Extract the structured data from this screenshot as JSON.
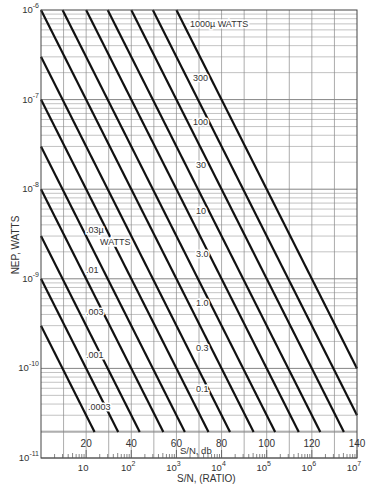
{
  "chart_data": {
    "type": "line",
    "title": "",
    "xlabel": "S/N, (RATIO)",
    "xlabel_secondary": "S/N, db",
    "ylabel": "NEP, WATTS",
    "xscale": "log",
    "yscale": "log",
    "xlim": [
      1,
      10000000
    ],
    "ylim": [
      1e-11,
      1e-06
    ],
    "grid": true,
    "legend": "none (inline line labels)",
    "x_ticks": [
      {
        "value": 10,
        "label": "10"
      },
      {
        "value": 100,
        "label": "10",
        "sup": "2"
      },
      {
        "value": 1000,
        "label": "10",
        "sup": "3"
      },
      {
        "value": 10000,
        "label": "10",
        "sup": "4"
      },
      {
        "value": 100000,
        "label": "10",
        "sup": "5"
      },
      {
        "value": 1000000,
        "label": "10",
        "sup": "6"
      },
      {
        "value": 10000000,
        "label": "10",
        "sup": "7"
      }
    ],
    "db_ticks": [
      {
        "db": 20,
        "label": "20"
      },
      {
        "db": 40,
        "label": "40"
      },
      {
        "db": 60,
        "label": "60"
      },
      {
        "db": 80,
        "label": "80"
      },
      {
        "db": 100,
        "label": "100"
      },
      {
        "db": 120,
        "label": "120"
      },
      {
        "db": 140,
        "label": "140"
      }
    ],
    "y_ticks": [
      {
        "value": 1e-06,
        "label": "10",
        "sup": "-6"
      },
      {
        "value": 1e-07,
        "label": "10",
        "sup": "-7"
      },
      {
        "value": 1e-08,
        "label": "10",
        "sup": "-8"
      },
      {
        "value": 1e-09,
        "label": "10",
        "sup": "-9"
      },
      {
        "value": 1e-10,
        "label": "10",
        "sup": "-10"
      },
      {
        "value": 1e-11,
        "label": "10",
        "sup": "-11"
      }
    ],
    "relation": "NEP = signal power / (S/N ratio)",
    "series": [
      {
        "name": "0.0003 µW",
        "power_uW": 0.0003,
        "label": ".0003",
        "label_pos": [
          88,
          410
        ]
      },
      {
        "name": "0.001 µW",
        "power_uW": 0.001,
        "label": ".001",
        "label_pos": [
          86,
          358
        ]
      },
      {
        "name": "0.003 µW",
        "power_uW": 0.003,
        "label": ".003",
        "label_pos": [
          86,
          315
        ]
      },
      {
        "name": "0.01 µW",
        "power_uW": 0.01,
        "label": ".01",
        "label_pos": [
          86,
          273
        ]
      },
      {
        "name": "0.03 µW",
        "power_uW": 0.03,
        "label": ".03µ",
        "label2": "WATTS",
        "label_pos": [
          86,
          233
        ]
      },
      {
        "name": "0.1 µW",
        "power_uW": 0.1,
        "label": "0.1",
        "label_pos": [
          196,
          392
        ]
      },
      {
        "name": "0.3 µW",
        "power_uW": 0.3,
        "label": "0.3",
        "label_pos": [
          196,
          351
        ]
      },
      {
        "name": "1.0 µW",
        "power_uW": 1.0,
        "label": "1.0",
        "label_pos": [
          196,
          306
        ]
      },
      {
        "name": "3.0 µW",
        "power_uW": 3.0,
        "label": "3.0",
        "label_pos": [
          196,
          257
        ]
      },
      {
        "name": "10 µW",
        "power_uW": 10,
        "label": "10",
        "label_pos": [
          196,
          214
        ]
      },
      {
        "name": "30 µW",
        "power_uW": 30,
        "label": "30",
        "label_pos": [
          196,
          168
        ]
      },
      {
        "name": "100 µW",
        "power_uW": 100,
        "label": "100",
        "label_pos": [
          193,
          125
        ]
      },
      {
        "name": "300 µW",
        "power_uW": 300,
        "label": "300",
        "label_pos": [
          193,
          81
        ]
      },
      {
        "name": "1000 µW",
        "power_uW": 1000,
        "label": "1000µ WATTS",
        "label_pos": [
          190,
          27
        ]
      }
    ]
  }
}
